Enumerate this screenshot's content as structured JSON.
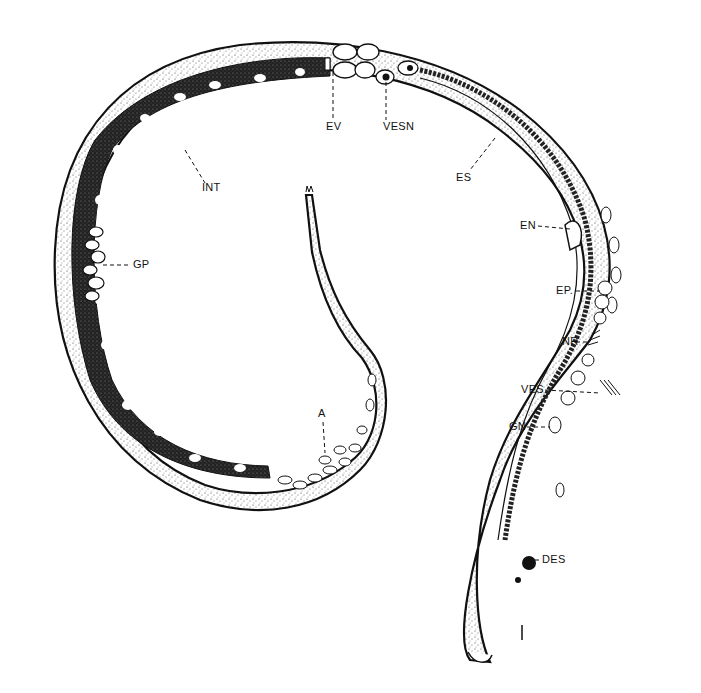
{
  "figure": {
    "colors": {
      "ink": "#111111",
      "stipple": "#555555",
      "background": "#ffffff",
      "cell": "#f4f4f4"
    }
  },
  "labels": [
    {
      "id": "INT",
      "text": "INT",
      "x": 202,
      "y": 188
    },
    {
      "id": "EV",
      "text": "EV",
      "x": 327,
      "y": 125
    },
    {
      "id": "VESN",
      "text": "VESN",
      "x": 386,
      "y": 125
    },
    {
      "id": "ES",
      "text": "ES",
      "x": 458,
      "y": 176
    },
    {
      "id": "EN",
      "text": "EN",
      "x": 519,
      "y": 222
    },
    {
      "id": "GP",
      "text": "GP",
      "x": 133,
      "y": 262
    },
    {
      "id": "EP",
      "text": "EP.",
      "x": 556,
      "y": 287
    },
    {
      "id": "NR",
      "text": "NR",
      "x": 562,
      "y": 338
    },
    {
      "id": "VES",
      "text": "VES",
      "x": 520,
      "y": 386
    },
    {
      "id": "GN",
      "text": "GN",
      "x": 509,
      "y": 423
    },
    {
      "id": "A",
      "text": "A",
      "x": 315,
      "y": 409
    },
    {
      "id": "DES",
      "text": "DES",
      "x": 541,
      "y": 556
    },
    {
      "id": "scale",
      "text": "I",
      "x": 520,
      "y": 630
    }
  ]
}
